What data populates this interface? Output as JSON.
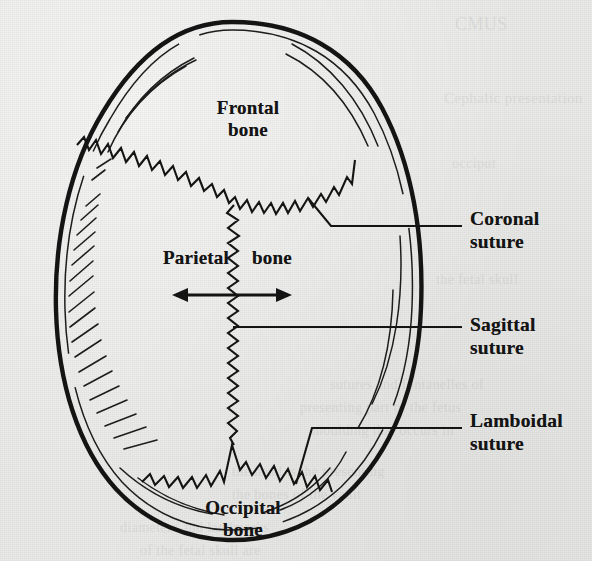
{
  "figure": {
    "view": "superior (top-down) view of the cranium",
    "background_color": "#e9e9e7",
    "ink_color": "#141414"
  },
  "bone_labels": [
    {
      "id": "frontal",
      "line1": "Frontal",
      "line2": "bone",
      "x": 248,
      "y": 97
    },
    {
      "id": "parietal-left",
      "line1": "Parietal",
      "line2": "",
      "x": 196,
      "y": 247
    },
    {
      "id": "parietal-right",
      "line1": "bone",
      "line2": "",
      "x": 272,
      "y": 247
    },
    {
      "id": "occipital",
      "line1": "Occipital",
      "line2": "bone",
      "x": 243,
      "y": 497
    }
  ],
  "suture_labels": [
    {
      "id": "coronal",
      "line1": "Coronal",
      "line2": "suture",
      "x": 470,
      "y": 221
    },
    {
      "id": "sagittal",
      "line1": "Sagittal",
      "line2": "suture",
      "x": 470,
      "y": 327
    },
    {
      "id": "lamboidal",
      "line1": "Lamboidal",
      "line2": "suture",
      "x": 470,
      "y": 423
    }
  ],
  "sutures": [
    {
      "id": "coronal-suture",
      "name": "Coronal suture",
      "shape": "zigzag-v",
      "from": [
        77,
        145
      ],
      "vertex": [
        235,
        215
      ],
      "to": [
        355,
        160
      ]
    },
    {
      "id": "sagittal-suture",
      "name": "Sagittal suture",
      "shape": "zigzag-vertical",
      "from": [
        232,
        215
      ],
      "to": [
        232,
        445
      ]
    },
    {
      "id": "lamboidal-suture",
      "name": "Lamboidal suture",
      "shape": "zigzag-lambda",
      "from": [
        142,
        480
      ],
      "vertex": [
        232,
        445
      ],
      "to": [
        332,
        490
      ]
    }
  ],
  "annotations": {
    "width_arrow": {
      "id": "transverse-diameter-arrow",
      "description": "double-headed horizontal arrow across parietal bones",
      "x_start": 172,
      "x_end": 292,
      "y": 295
    }
  },
  "ghost_text": [
    {
      "t": "CMUS",
      "x": 455,
      "y": 14,
      "size": 18
    },
    {
      "t": "Cephalic presentation",
      "x": 444,
      "y": 90,
      "size": 15
    },
    {
      "t": "occiput",
      "x": 452,
      "y": 156,
      "size": 14
    },
    {
      "t": "the fetal skull",
      "x": 436,
      "y": 272,
      "size": 14
    },
    {
      "t": "sutures and fontanelles of",
      "x": 330,
      "y": 377,
      "size": 14
    },
    {
      "t": "presenting part of the fetus",
      "x": 300,
      "y": 400,
      "size": 14
    },
    {
      "t": "moulding that occurs in",
      "x": 312,
      "y": 423,
      "size": 14
    },
    {
      "t": "the head is the presenting",
      "x": 232,
      "y": 464,
      "size": 14
    },
    {
      "t": "the bones of the vault",
      "x": 232,
      "y": 487,
      "size": 14
    },
    {
      "t": "diameters and landmarks",
      "x": 120,
      "y": 520,
      "size": 14
    },
    {
      "t": "of the fetal skull are",
      "x": 140,
      "y": 543,
      "size": 14
    }
  ]
}
